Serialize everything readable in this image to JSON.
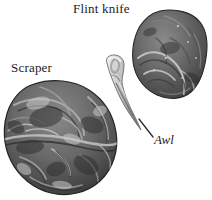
{
  "figure": {
    "background_color": "#ffffff",
    "width": 212,
    "height": 200,
    "style": "grayscale halftone photograph of prehistoric flint tools"
  },
  "labels": {
    "flint_knife": "Flint knife",
    "scraper": "Scraper",
    "awl": "Awl"
  },
  "artifacts": [
    {
      "name": "flint-knife",
      "label": "Flint knife",
      "description": "rounded dark flint nodule with flaked facets, upper right",
      "position": {
        "x": 132,
        "y": 11,
        "width": 75,
        "height": 87
      },
      "colors": {
        "base": "#6e6e6e",
        "shadow": "#3a3a3a",
        "highlight": "#b8b8b8",
        "outline": "#2f2f2f"
      }
    },
    {
      "name": "awl",
      "label": "Awl",
      "description": "long narrow tapering flint point with rounded hollow head, center",
      "position": {
        "x": 102,
        "y": 55,
        "width": 40,
        "height": 76
      },
      "colors": {
        "base": "#c9c9c9",
        "shadow": "#7d7d7d",
        "highlight": "#f0f0f0",
        "outline": "#5a5a5a"
      }
    },
    {
      "name": "scraper",
      "label": "Scraper",
      "description": "large rounded triangular flint scraper with deep conchoidal flake scars, lower left",
      "position": {
        "x": 3,
        "y": 80,
        "width": 118,
        "height": 114
      },
      "colors": {
        "base": "#6a6a6a",
        "shadow": "#343434",
        "highlight": "#b4b4b4",
        "outline": "#2b2b2b"
      }
    }
  ],
  "leader_lines": [
    {
      "name": "awl-leader-line",
      "from": {
        "x": 139,
        "y": 119
      },
      "to": {
        "x": 153,
        "y": 137
      },
      "color": "#2a2a2a"
    }
  ]
}
